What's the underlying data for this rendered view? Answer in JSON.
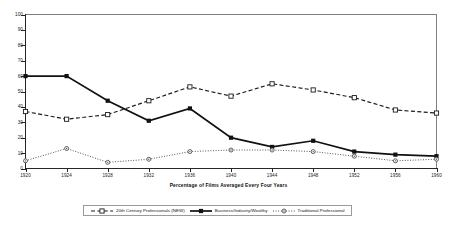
{
  "chart_data": {
    "type": "line",
    "title": "",
    "xlabel": "Percentage of Films Averaged Every Four Years",
    "ylabel": "",
    "categories": [
      "1920",
      "1924",
      "1928",
      "1932",
      "1936",
      "1940",
      "1944",
      "1948",
      "1952",
      "1956",
      "1960"
    ],
    "x": [
      1920,
      1924,
      1928,
      1932,
      1936,
      1940,
      1944,
      1948,
      1952,
      1956,
      1960
    ],
    "xlim": [
      1920,
      1960
    ],
    "ylim": [
      0,
      100
    ],
    "yticks": [
      0,
      10,
      20,
      30,
      40,
      50,
      60,
      70,
      80,
      90,
      100
    ],
    "ytick_labels": [
      "0",
      "10",
      "20",
      "30",
      "40",
      "50",
      "60",
      "70",
      "80",
      "90",
      "100"
    ],
    "grid": false,
    "legend_position": "bottom",
    "series": [
      {
        "name": "20th Century Professionals (NEW)",
        "values": [
          37,
          32,
          35,
          44,
          53,
          47,
          55,
          51,
          46,
          38,
          36
        ],
        "line_style": "dashed",
        "marker": "open-square",
        "color": "#1a1a1a"
      },
      {
        "name": "Business/Industry/Wealthy",
        "values": [
          60,
          60,
          44,
          31,
          39,
          20,
          14,
          18,
          11,
          9,
          8
        ],
        "line_style": "solid",
        "marker": "filled-square",
        "color": "#111111"
      },
      {
        "name": "Traditional Professional",
        "values": [
          5,
          13,
          4,
          6,
          11,
          12,
          12,
          11,
          8,
          5,
          6
        ],
        "line_style": "dotted",
        "marker": "open-circle-dot",
        "color": "#4d4d4d"
      }
    ]
  },
  "legend": {
    "entries": [
      {
        "label": "20th Century Professionals (NEW)"
      },
      {
        "label": "Business/Industry/Wealthy"
      },
      {
        "label": "Traditional Professional"
      }
    ]
  },
  "axis": {
    "x_title": "Percentage of Films Averaged Every Four Years"
  }
}
